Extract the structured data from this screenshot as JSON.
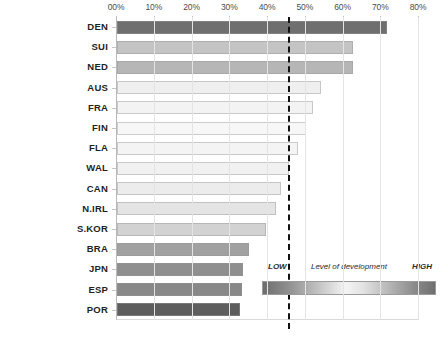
{
  "chart_data": {
    "type": "bar",
    "orientation": "horizontal",
    "title": "",
    "xlabel": "",
    "ylabel": "",
    "xlim": [
      0,
      80
    ],
    "xticks": [
      0,
      10,
      20,
      30,
      40,
      50,
      60,
      70,
      80
    ],
    "xtick_labels": [
      "00%",
      "10%",
      "20%",
      "30%",
      "40%",
      "50%",
      "60%",
      "70%",
      "80%"
    ],
    "grid": true,
    "legend_position": "bottom-right",
    "categories": [
      "DEN",
      "SUI",
      "NED",
      "AUS",
      "FRA",
      "FIN",
      "FLA",
      "WAL",
      "CAN",
      "N.IRL",
      "S.KOR",
      "BRA",
      "JPN",
      "ESP",
      "POR"
    ],
    "values": [
      71.5,
      62.5,
      62.5,
      54.0,
      52.0,
      50.0,
      48.0,
      45.5,
      43.5,
      42.0,
      39.5,
      35.0,
      33.5,
      33.0,
      32.5
    ],
    "bar_colors": [
      "#6f6f6f",
      "#c4c4c4",
      "#b6b6b6",
      "#efefef",
      "#f3f3f3",
      "#f7f7f7",
      "#f4f4f4",
      "#f1f1f1",
      "#ececec",
      "#e4e4e4",
      "#d2d2d2",
      "#a1a1a1",
      "#8f8f8f",
      "#888888",
      "#5d5d5d"
    ],
    "annotations": [
      {
        "name": "threshold-line",
        "type": "vline",
        "value": 45.5,
        "style": "dashed",
        "color": "#111111"
      }
    ]
  },
  "legend": {
    "low_label": "LOW",
    "title": "Level of development",
    "high_label": "HIGH"
  }
}
